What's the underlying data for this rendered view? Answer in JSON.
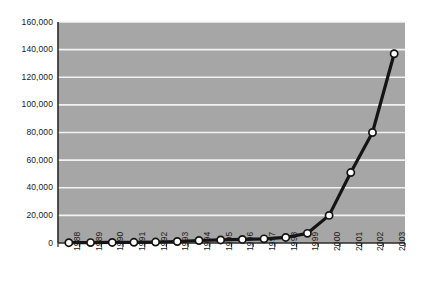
{
  "chart_data": {
    "type": "line",
    "title": "",
    "subtitle": "",
    "xlabel": "",
    "ylabel": "",
    "categories": [
      "1988",
      "1989",
      "1990",
      "1991",
      "1992",
      "1993",
      "1994",
      "1995",
      "1996",
      "1997",
      "1998",
      "1999",
      "2000",
      "2001",
      "2002",
      "2003"
    ],
    "values": [
      200,
      300,
      400,
      500,
      700,
      1100,
      1800,
      2200,
      2600,
      3000,
      4000,
      7000,
      20000,
      51000,
      80000,
      137000
    ],
    "series": [
      {
        "name": "series-1",
        "values": [
          200,
          300,
          400,
          500,
          700,
          1100,
          1800,
          2200,
          2600,
          3000,
          4000,
          7000,
          20000,
          51000,
          80000,
          137000
        ]
      }
    ],
    "ylim": [
      0,
      160000
    ],
    "yticks": [
      0,
      20000,
      40000,
      60000,
      80000,
      100000,
      120000,
      140000,
      160000
    ],
    "ytick_labels": [
      "0",
      "20,000",
      "40,000",
      "60,000",
      "80,000",
      "100,000",
      "120,000",
      "140,000",
      "160,000"
    ],
    "grid": true,
    "grid_axis": "y",
    "legend": false,
    "legend_position": "none",
    "marker": "circle",
    "annotations": []
  },
  "style": {
    "plot_background": "#a6a6a6",
    "grid_color": "#f2f2f2",
    "line_color": "#141414",
    "marker_fill": "#ffffff",
    "marker_edge": "#141414",
    "axis_color": "#2b2b2b",
    "text_color": "#1a1a1a",
    "page_background": "#ffffff"
  },
  "geometry": {
    "plot_left": 58,
    "plot_right": 405,
    "plot_top": 22,
    "plot_bottom": 243
  }
}
